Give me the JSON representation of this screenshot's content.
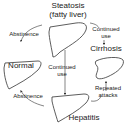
{
  "diagram": {
    "type": "flow",
    "nodes": {
      "steatosis": {
        "title": "Steatosis",
        "subtitle": "(fatty liver)"
      },
      "normal": {
        "title": "Normal"
      },
      "cirrhosis": {
        "title": "Cirrhosis"
      },
      "hepatitis": {
        "title": "Hepatitis"
      }
    },
    "edges": {
      "steatosis_to_normal": {
        "label": "Abstinence"
      },
      "steatosis_to_cirrhosis": {
        "label_line1": "Continued",
        "label_line2": "use"
      },
      "steatosis_to_hepatitis": {
        "label_line1": "Continued",
        "label_line2": "use"
      },
      "hepatitis_to_normal": {
        "label": "Abstinence"
      },
      "hepatitis_to_cirrhosis": {
        "label_line1": "Repeated",
        "label_line2": "attacks"
      }
    },
    "colors": {
      "stroke": "#333333",
      "text": "#222222",
      "background": "#ffffff"
    }
  }
}
